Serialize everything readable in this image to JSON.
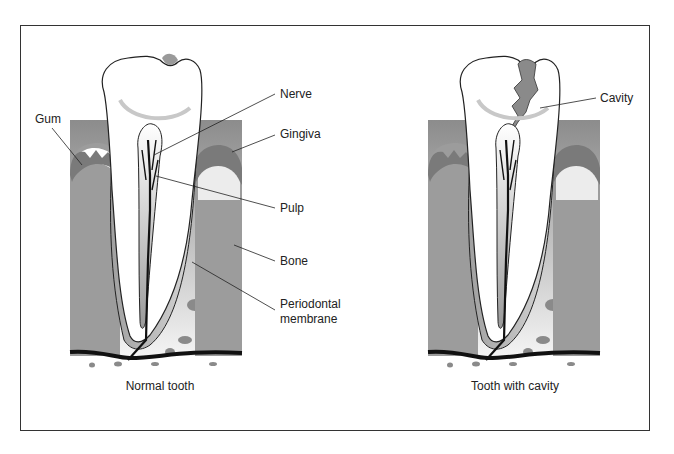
{
  "figure": {
    "panels": [
      {
        "caption": "Normal tooth",
        "labels": {
          "gum": "Gum",
          "nerve": "Nerve",
          "gingiva": "Gingiva",
          "pulp": "Pulp",
          "bone": "Bone",
          "periodontal_line1": "Periodontal",
          "periodontal_line2": "membrane"
        }
      },
      {
        "caption": "Tooth with cavity",
        "labels": {
          "cavity": "Cavity"
        }
      }
    ]
  },
  "colors": {
    "outline": "#222222",
    "bone_top": "#8f8f8f",
    "bone_bottom": "#f2f2f2",
    "gum_dark": "#777777",
    "cavity": "#8a8a8a"
  }
}
